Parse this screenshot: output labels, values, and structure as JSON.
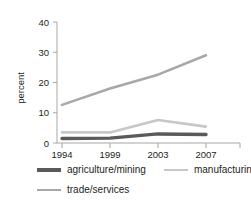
{
  "chart_data": {
    "type": "line",
    "title": "",
    "subtitle": "",
    "xlabel": "",
    "ylabel": "percent",
    "categories": [
      "1994",
      "1999",
      "2003",
      "2007"
    ],
    "x_tick_labels": [
      "1994",
      "1999",
      "2003",
      "2007"
    ],
    "y_tick_labels": [
      "0",
      "10",
      "20",
      "30",
      "40"
    ],
    "y_ticks": [
      0,
      10,
      20,
      30,
      40
    ],
    "ylim": [
      0,
      40
    ],
    "grid": false,
    "legend_position": "bottom",
    "series": [
      {
        "name": "agriculture/mining",
        "color": "#5a5a5a",
        "line_width": 3.4,
        "values": [
          1.5,
          1.6,
          3.0,
          2.8
        ]
      },
      {
        "name": "manufacturing",
        "color": "#c7c7c7",
        "line_width": 2.6,
        "values": [
          3.5,
          3.5,
          7.6,
          5.4
        ]
      },
      {
        "name": "trade/services",
        "color": "#a8a8a8",
        "line_width": 2.6,
        "values": [
          12.6,
          18.0,
          22.6,
          29.0
        ]
      }
    ]
  },
  "axis": {
    "y_label": "percent",
    "tick_0": "0",
    "tick_10": "10",
    "tick_20": "20",
    "tick_30": "30",
    "tick_40": "40",
    "x_1": "1994",
    "x_2": "1999",
    "x_3": "2003",
    "x_4": "2007",
    "axis_color": "#a6a6a6"
  },
  "legend": {
    "items": [
      {
        "label": "agriculture/mining",
        "color": "#5a5a5a"
      },
      {
        "label": "manufacturing",
        "color": "#c7c7c7"
      },
      {
        "label": "trade/services",
        "color": "#a8a8a8"
      }
    ]
  }
}
